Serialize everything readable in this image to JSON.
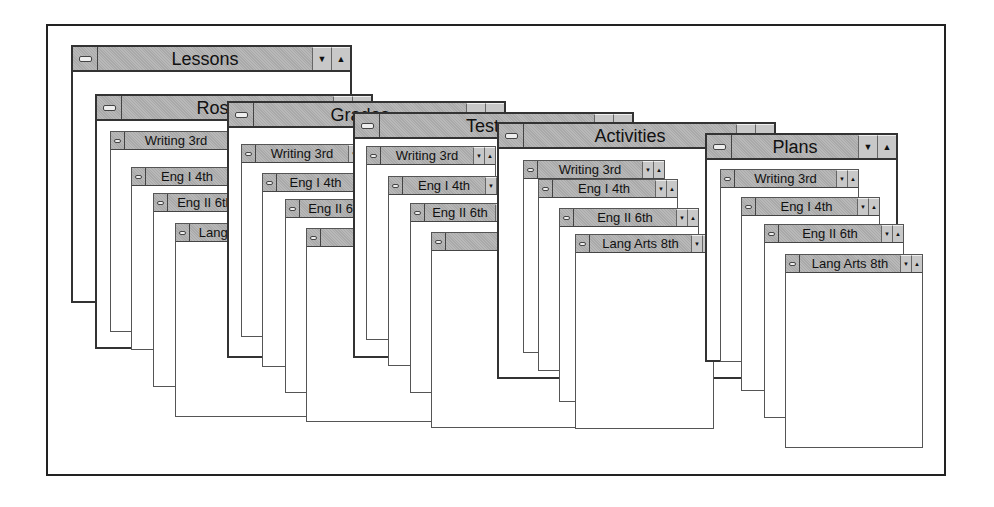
{
  "figure": {
    "top_windows": [
      {
        "title": "Lessons",
        "buttons": [
          "down-arrow",
          "up-arrow"
        ],
        "children": []
      },
      {
        "title": "Rosters",
        "children": [
          "Writing 3rd",
          "Eng I 4th",
          "Eng II 6th",
          "Lang Arts 8th"
        ]
      },
      {
        "title": "Grades",
        "children": [
          "Writing 3rd",
          "Eng I 4th",
          "Eng II 6th",
          "Lang Arts 8th"
        ]
      },
      {
        "title": "Tests",
        "children": [
          "Writing 3rd",
          "Eng I 4th",
          "Eng II 6th",
          "Lang Arts 8th"
        ]
      },
      {
        "title": "Activities",
        "children": [
          "Writing 3rd",
          "Eng I 4th",
          "Eng II 6th",
          "Lang Arts 8th"
        ]
      },
      {
        "title": "Plans",
        "buttons": [
          "down-arrow",
          "up-arrow"
        ],
        "children": [
          "Writing 3rd",
          "Eng I 4th",
          "Eng II 6th",
          "Lang Arts 8th"
        ]
      }
    ]
  },
  "glyphs": {
    "down": "▼",
    "up": "▲"
  },
  "colors": {
    "titlebar": "#a9a9a9",
    "border": "#333333",
    "background": "#ffffff"
  }
}
